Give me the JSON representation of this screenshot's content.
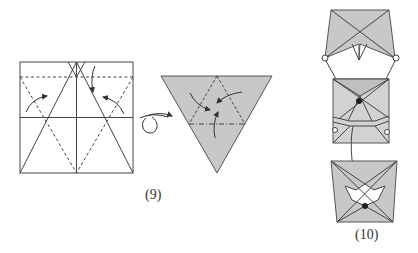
{
  "figure": {
    "type": "origami-instruction-diagram",
    "steps": [
      {
        "label": "(9)",
        "views": [
          "unfolded square with crease pattern: vertical and horizontal center lines, two solid diagonals forming an A-shape from bottom corners to top center, dashed valley lines forming an inverted V from top corners to bottom center, and a dashed horizontal line near the top; three curved arrows indicate folding",
          "turn-over symbol (looped arrow)",
          "shaded inverted triangle with an inner dashed triangle and a dash-dot horizontal line; three curved arrows indicate collapsing toward the centre"
        ]
      },
      {
        "label": "(10)",
        "views": [
          "shaded top model with crossed diagonals and a downward notch; small circles mark the lower corners",
          "middle square model with a black dot near the center, a horizontal band, and small circles marking reference points",
          "bottom model with a white star-shaped opening and a black dot; a line connects it to the middle model"
        ]
      }
    ],
    "colors": {
      "paper_shade": "#c8c8c8",
      "line": "#444444",
      "dot": "#222222",
      "background": "#ffffff"
    }
  }
}
